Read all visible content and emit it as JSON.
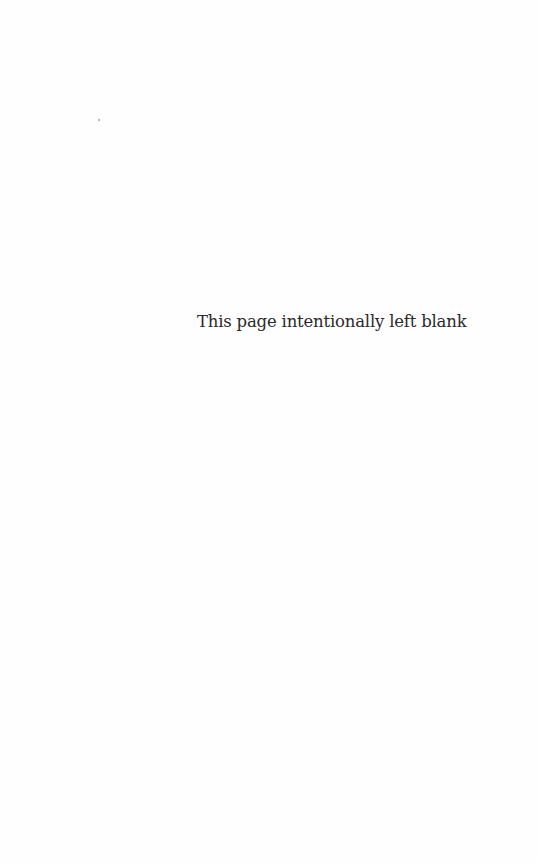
{
  "page": {
    "notice_text": "This page intentionally left blank"
  }
}
